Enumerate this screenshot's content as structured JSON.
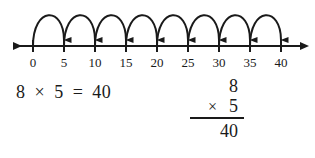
{
  "figure": {
    "type": "number-line-skip-counting",
    "axis": {
      "min": 0,
      "max": 40,
      "step": 5,
      "left_arrow": true,
      "right_arrow": true
    },
    "tick_labels": [
      "0",
      "5",
      "10",
      "15",
      "20",
      "25",
      "30",
      "35",
      "40"
    ],
    "jumps": [
      {
        "from": "0",
        "to": "5"
      },
      {
        "from": "5",
        "to": "10"
      },
      {
        "from": "10",
        "to": "15"
      },
      {
        "from": "15",
        "to": "20"
      },
      {
        "from": "20",
        "to": "25"
      },
      {
        "from": "25",
        "to": "30"
      },
      {
        "from": "30",
        "to": "35"
      },
      {
        "from": "35",
        "to": "40"
      }
    ],
    "jump_count": 8,
    "jump_size": 5,
    "line_color": "#1a1a1a"
  },
  "horizontal_equation": {
    "factor1": "8",
    "operator": "×",
    "factor2": "5",
    "equals": "=",
    "product": "40"
  },
  "vertical_multiplication": {
    "top_factor": "8",
    "operator": "×",
    "bottom_factor": "5",
    "product": "40"
  }
}
